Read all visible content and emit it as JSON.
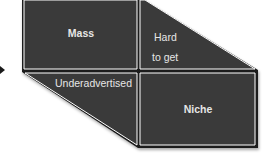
{
  "diagram": {
    "quadrants": {
      "top_left": {
        "label": "Mass"
      },
      "top_right": {
        "label_line1": "Hard",
        "label_line2": "to get"
      },
      "bottom_left": {
        "label": "Underadvertised"
      },
      "bottom_right": {
        "label": "Niche"
      }
    },
    "colors": {
      "fill": "#3a3a3a",
      "border": "#ffffff",
      "outline": "#1a1a1a",
      "text": "#e6e6e6"
    },
    "arrow": {
      "icon": "arrow-right-icon"
    }
  }
}
